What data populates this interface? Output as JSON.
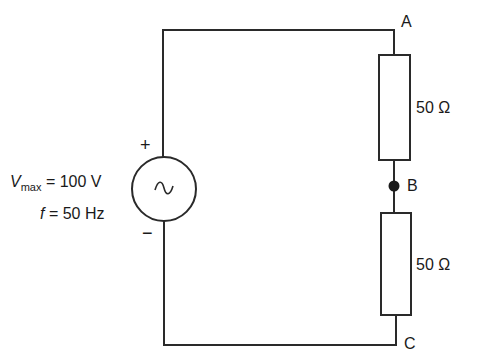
{
  "diagram": {
    "type": "circuit",
    "source": {
      "symbol": "~",
      "polarity_plus": "+",
      "polarity_minus": "−",
      "vmax_symbol": "V",
      "vmax_sub": "max",
      "vmax_value": "= 100 V",
      "freq_symbol": "f",
      "freq_value": "= 50 Hz"
    },
    "nodes": {
      "a": "A",
      "b": "B",
      "c": "C"
    },
    "resistors": [
      {
        "id": "R1",
        "label": "50 Ω",
        "between": "A-B"
      },
      {
        "id": "R2",
        "label": "50 Ω",
        "between": "B-C"
      }
    ],
    "colors": {
      "stroke": "#2a2a2a",
      "background": "#ffffff"
    }
  }
}
